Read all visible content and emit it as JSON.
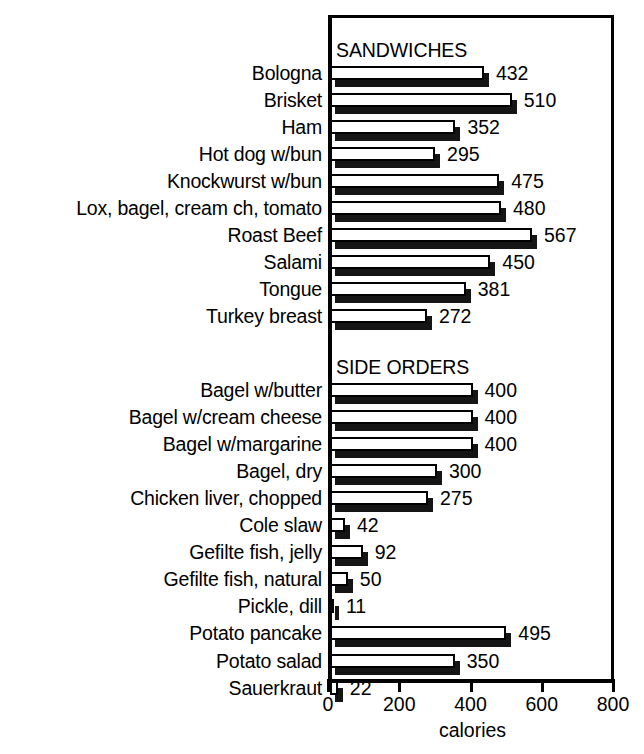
{
  "chart_data": {
    "type": "bar",
    "orientation": "horizontal",
    "title": "",
    "xlabel": "calories",
    "ylabel": "",
    "xlim": [
      0,
      800
    ],
    "xticks": [
      0,
      200,
      400,
      600,
      800
    ],
    "xtick_labels": [
      "0",
      "200",
      "400",
      "600",
      "800"
    ],
    "grid": false,
    "legend": null,
    "value_labels": true,
    "sections": [
      {
        "heading": "SANDWICHES",
        "categories": [
          "Bologna",
          "Brisket",
          "Ham",
          "Hot dog w/bun",
          "Knockwurst w/bun",
          "Lox, bagel, cream ch, tomato",
          "Roast Beef",
          "Salami",
          "Tongue",
          "Turkey breast"
        ],
        "values": [
          432,
          510,
          352,
          295,
          475,
          480,
          567,
          450,
          381,
          272
        ]
      },
      {
        "heading": "SIDE ORDERS",
        "categories": [
          "Bagel w/butter",
          "Bagel w/cream cheese",
          "Bagel w/margarine",
          "Bagel, dry",
          "Chicken liver, chopped",
          "Cole slaw",
          "Gefilte fish, jelly",
          "Gefilte fish, natural",
          "Pickle, dill",
          "Potato pancake",
          "Potato salad",
          "Sauerkraut"
        ],
        "values": [
          400,
          400,
          400,
          300,
          275,
          42,
          92,
          50,
          11,
          495,
          350,
          22
        ]
      }
    ],
    "categories": [
      "Bologna",
      "Brisket",
      "Ham",
      "Hot dog w/bun",
      "Knockwurst w/bun",
      "Lox, bagel, cream ch, tomato",
      "Roast Beef",
      "Salami",
      "Tongue",
      "Turkey breast",
      "Bagel w/butter",
      "Bagel w/cream cheese",
      "Bagel w/margarine",
      "Bagel, dry",
      "Chicken liver, chopped",
      "Cole slaw",
      "Gefilte fish, jelly",
      "Gefilte fish, natural",
      "Pickle, dill",
      "Potato pancake",
      "Potato salad",
      "Sauerkraut"
    ],
    "values": [
      432,
      510,
      352,
      295,
      475,
      480,
      567,
      450,
      381,
      272,
      400,
      400,
      400,
      300,
      275,
      42,
      92,
      50,
      11,
      495,
      350,
      22
    ],
    "colors": {
      "bar_face": "#ffffff",
      "bar_outline": "#000000",
      "bar_shadow": "#151515",
      "axis": "#000000",
      "text": "#000000",
      "background": "#ffffff"
    }
  }
}
